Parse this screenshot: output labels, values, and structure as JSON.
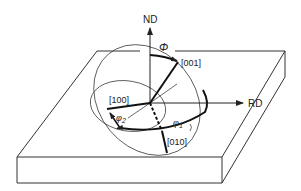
{
  "diagram": {
    "axes": {
      "normal_direction": "ND",
      "rolling_direction": "RD"
    },
    "crystal_directions": {
      "d001": "[001]",
      "d100": "[100]",
      "d010": "[010]"
    },
    "angles": {
      "Phi": "Φ",
      "phi1_symbol": "φ",
      "phi1_sub": "1",
      "phi2_symbol": "φ",
      "phi2_sub": "2"
    },
    "colors": {
      "line": "#222222",
      "background": "#ffffff"
    }
  }
}
